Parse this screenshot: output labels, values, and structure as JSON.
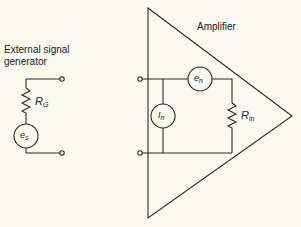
{
  "generator": {
    "title_line1": "External signal",
    "title_line2": "generator",
    "resistor": {
      "symbol": "R",
      "subscript": "G"
    },
    "source": {
      "symbol": "e",
      "subscript": "s"
    }
  },
  "amplifier": {
    "title": "Amplifier",
    "noise_voltage": {
      "symbol": "e",
      "subscript": "n"
    },
    "noise_current": {
      "symbol": "I",
      "subscript": "n"
    },
    "input_resistance": {
      "symbol": "R",
      "subscript": "in"
    }
  },
  "colors": {
    "background": "#fbfaf1",
    "line": "#2a2a2a"
  }
}
